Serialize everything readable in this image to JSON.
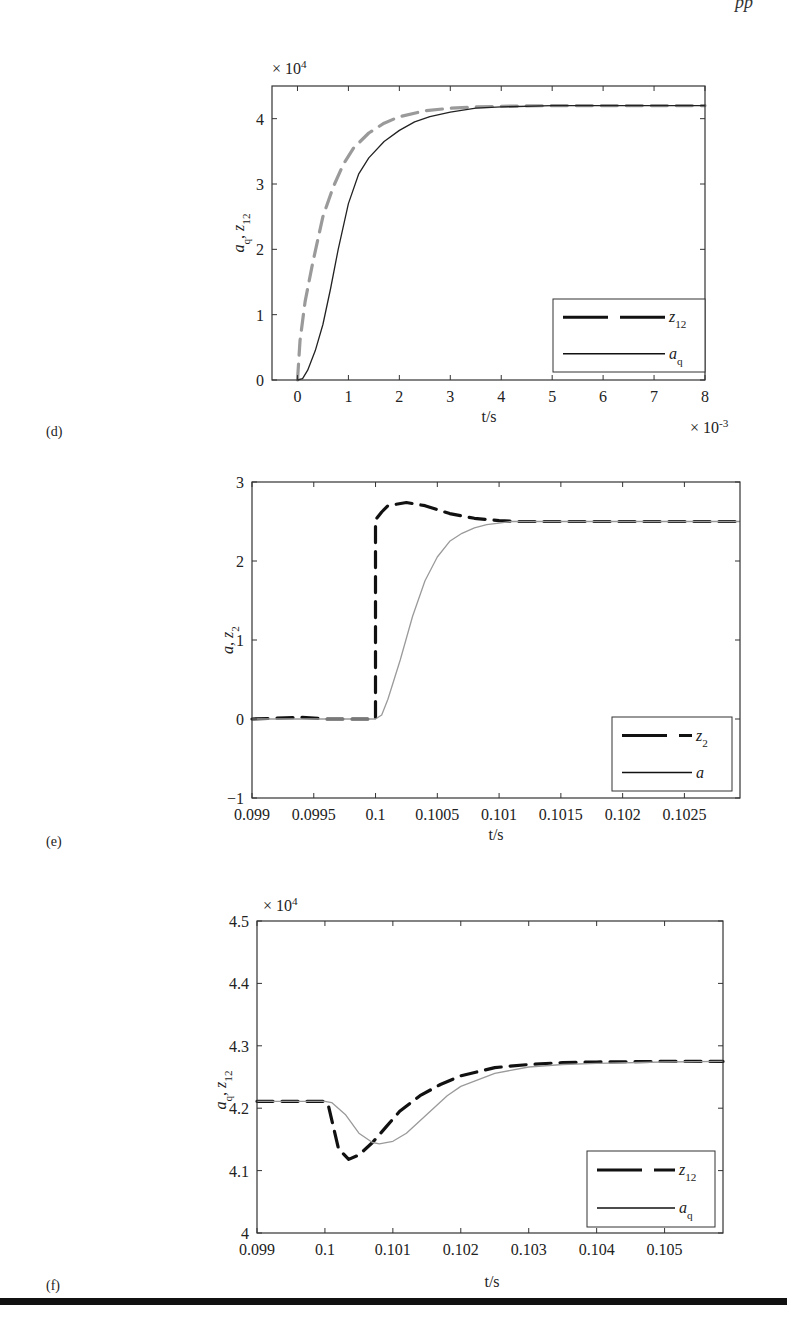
{
  "page": {
    "header_fragment": "pp",
    "bottom_rule": true
  },
  "chart_data": [
    {
      "panel": "(d)",
      "type": "line",
      "title": "",
      "xlabel": "t/s",
      "x_multiplier": "× 10^-3",
      "ylabel": "a_q, z_12",
      "y_multiplier": "× 10^4",
      "xlim": [
        -0.5,
        8
      ],
      "ylim": [
        0,
        4.5
      ],
      "xticks": [
        "0",
        "1",
        "2",
        "3",
        "4",
        "5",
        "6",
        "7",
        "8"
      ],
      "yticks": [
        "0",
        "1",
        "2",
        "3",
        "4"
      ],
      "grid": false,
      "legend_position": "lower right",
      "series": [
        {
          "name": "z_12",
          "style": "dashed",
          "color": "#9a9a9a",
          "x": [
            0,
            0.05,
            0.15,
            0.3,
            0.5,
            0.7,
            0.9,
            1.1,
            1.4,
            1.7,
            2.0,
            2.5,
            3.0,
            3.5,
            4.0,
            5.0,
            6.0,
            7.0,
            8.0
          ],
          "y": [
            0,
            0.6,
            1.2,
            1.8,
            2.5,
            2.95,
            3.3,
            3.55,
            3.78,
            3.93,
            4.03,
            4.12,
            4.16,
            4.18,
            4.19,
            4.2,
            4.2,
            4.2,
            4.2
          ]
        },
        {
          "name": "a_q",
          "style": "solid",
          "color": "#222222",
          "x": [
            0,
            0.1,
            0.2,
            0.35,
            0.5,
            0.65,
            0.8,
            1.0,
            1.2,
            1.4,
            1.7,
            2.0,
            2.3,
            2.6,
            3.0,
            3.5,
            4.0,
            5.0,
            6.0,
            7.0,
            8.0
          ],
          "y": [
            0,
            0.02,
            0.15,
            0.45,
            0.85,
            1.4,
            2.0,
            2.7,
            3.15,
            3.4,
            3.65,
            3.82,
            3.95,
            4.03,
            4.1,
            4.16,
            4.18,
            4.2,
            4.2,
            4.2,
            4.2
          ]
        }
      ]
    },
    {
      "panel": "(e)",
      "type": "line",
      "title": "",
      "xlabel": "t/s",
      "ylabel": "a, z_2",
      "xlim": [
        0.099,
        0.10295
      ],
      "ylim": [
        -1,
        3
      ],
      "xticks": [
        "0.099",
        "0.0995",
        "0.1",
        "0.1005",
        "0.101",
        "0.1015",
        "0.102",
        "0.1025"
      ],
      "yticks": [
        "-1",
        "0",
        "1",
        "2",
        "3"
      ],
      "grid": false,
      "legend_position": "lower right",
      "series": [
        {
          "name": "z_2",
          "style": "dashed",
          "color": "#111111",
          "x": [
            0.099,
            0.0992,
            0.0994,
            0.0996,
            0.0998,
            0.1,
            0.1,
            0.10005,
            0.1001,
            0.10025,
            0.1004,
            0.1006,
            0.1008,
            0.101,
            0.10115,
            0.1015,
            0.102,
            0.1025,
            0.10295
          ],
          "y": [
            0,
            0.01,
            0.02,
            0.0,
            0.0,
            0.0,
            2.52,
            2.62,
            2.7,
            2.74,
            2.7,
            2.6,
            2.54,
            2.51,
            2.5,
            2.5,
            2.5,
            2.5,
            2.5
          ]
        },
        {
          "name": "a",
          "style": "solid",
          "color": "#9a9a9a",
          "x": [
            0.099,
            0.0995,
            0.1,
            0.10005,
            0.1001,
            0.1002,
            0.1003,
            0.1004,
            0.1005,
            0.1006,
            0.1007,
            0.1008,
            0.1009,
            0.101,
            0.1011,
            0.1015,
            0.102,
            0.1025,
            0.10295
          ],
          "y": [
            0,
            0,
            0,
            0.05,
            0.25,
            0.75,
            1.3,
            1.75,
            2.05,
            2.25,
            2.35,
            2.42,
            2.46,
            2.48,
            2.5,
            2.5,
            2.5,
            2.5,
            2.5
          ]
        }
      ]
    },
    {
      "panel": "(f)",
      "type": "line",
      "title": "",
      "xlabel": "t/s",
      "ylabel": "a_q, z_12",
      "y_multiplier": "× 10^4",
      "xlim": [
        0.099,
        0.10586
      ],
      "ylim": [
        4.0,
        4.5
      ],
      "xticks": [
        "0.099",
        "0.1",
        "0.101",
        "0.102",
        "0.103",
        "0.104",
        "0.105"
      ],
      "yticks": [
        "4",
        "4.1",
        "4.2",
        "4.3",
        "4.4",
        "4.5"
      ],
      "grid": false,
      "legend_position": "lower right",
      "series": [
        {
          "name": "z_12",
          "style": "dashed",
          "color": "#111111",
          "x": [
            0.099,
            0.0995,
            0.1,
            0.10005,
            0.1002,
            0.10035,
            0.1005,
            0.1007,
            0.1009,
            0.1011,
            0.1014,
            0.1017,
            0.102,
            0.1025,
            0.103,
            0.1035,
            0.104,
            0.105,
            0.10586
          ],
          "y": [
            4.211,
            4.211,
            4.211,
            4.205,
            4.135,
            4.118,
            4.125,
            4.145,
            4.17,
            4.195,
            4.22,
            4.238,
            4.252,
            4.265,
            4.27,
            4.273,
            4.274,
            4.275,
            4.275
          ]
        },
        {
          "name": "a_q",
          "style": "solid",
          "color": "#9a9a9a",
          "x": [
            0.099,
            0.0995,
            0.1,
            0.1001,
            0.1003,
            0.1005,
            0.1007,
            0.1008,
            0.101,
            0.1012,
            0.1015,
            0.1018,
            0.102,
            0.1025,
            0.103,
            0.1035,
            0.104,
            0.105,
            0.10586
          ],
          "y": [
            4.211,
            4.211,
            4.211,
            4.209,
            4.19,
            4.16,
            4.145,
            4.143,
            4.147,
            4.16,
            4.19,
            4.22,
            4.235,
            4.256,
            4.266,
            4.27,
            4.272,
            4.274,
            4.275
          ]
        }
      ]
    }
  ]
}
